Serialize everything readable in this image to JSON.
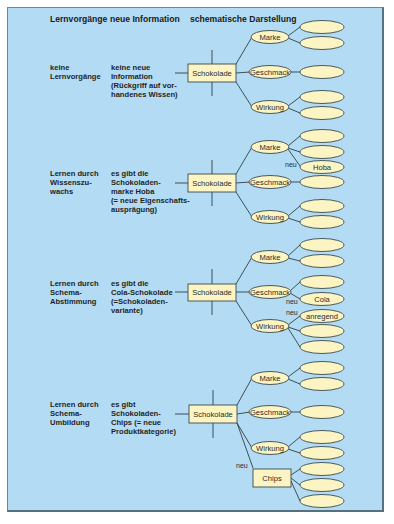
{
  "header": {
    "col1": "Lernvorgänge",
    "col2": "neue Information",
    "col3": "schematische Darstellung"
  },
  "colors": {
    "background": "#b3dcf4",
    "node_fill": "#fcf5c3",
    "line": "#2f3f44"
  },
  "rows": [
    {
      "process": [
        "keine",
        "Lernvorgänge"
      ],
      "info": [
        "keine neue",
        "Information",
        "(Rückgriff auf vor-",
        "handenes Wissen)"
      ],
      "root": "Schokolade",
      "branches": [
        {
          "label": "Marke",
          "children": [
            "",
            ""
          ]
        },
        {
          "label": "Geschmack",
          "children": [
            ""
          ]
        },
        {
          "label": "Wirkung",
          "children": [
            "",
            ""
          ]
        }
      ]
    },
    {
      "process": [
        "Lernen durch",
        "Wissenszu-",
        "wachs"
      ],
      "info": [
        "es gibt die",
        "Schokoladen-",
        "marke Hoba",
        "(= neue Eigenschafts-",
        "ausprägung)"
      ],
      "root": "Schokolade",
      "branches": [
        {
          "label": "Marke",
          "children": [
            "",
            "",
            "Hoba"
          ],
          "new_label": "neu"
        },
        {
          "label": "Geschmack",
          "children": [
            ""
          ]
        },
        {
          "label": "Wirkung",
          "children": [
            "",
            ""
          ]
        }
      ]
    },
    {
      "process": [
        "Lernen durch",
        "Schema-",
        "Abstimmung"
      ],
      "info": [
        "es gibt die",
        "Cola-Schokolade",
        "(=Schokoladen-",
        "variante)"
      ],
      "root": "Schokolade",
      "branches": [
        {
          "label": "Marke",
          "children": [
            "",
            ""
          ]
        },
        {
          "label": "Geschmack",
          "children": [
            "",
            "Cola"
          ],
          "new_label": "neu"
        },
        {
          "label": "Wirkung",
          "children": [
            "anregend",
            "",
            ""
          ],
          "new_label": "neu"
        }
      ]
    },
    {
      "process": [
        "Lernen durch",
        "Schema-",
        "Umbildung"
      ],
      "info": [
        "es gibt",
        "Schokoladen-",
        "Chips (= neue",
        "Produktkategorie)"
      ],
      "root": "Schokolade",
      "branches": [
        {
          "label": "Marke",
          "children": [
            "",
            ""
          ]
        },
        {
          "label": "Geschmack",
          "children": [
            ""
          ]
        },
        {
          "label": "Wirkung",
          "children": [
            "",
            ""
          ]
        },
        {
          "label": "Chips",
          "children": [
            "",
            "",
            ""
          ],
          "new_label": "neu"
        }
      ]
    }
  ]
}
